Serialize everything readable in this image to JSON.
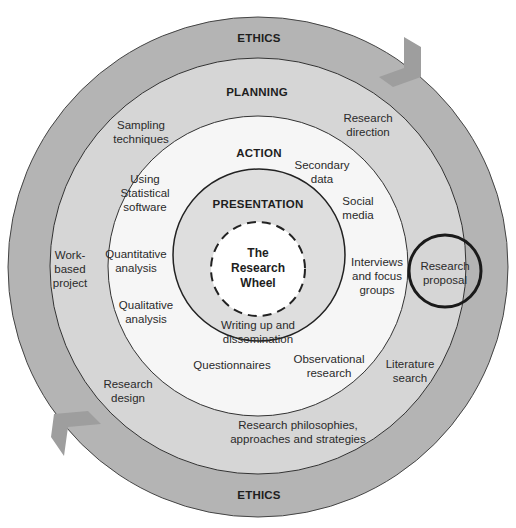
{
  "diagram": {
    "title": "The Research Wheel",
    "colors": {
      "ethics_ring": "#b4b4b4",
      "planning_ring": "#d6d6d6",
      "action_ring": "#f6f6f6",
      "presentation_ring": "#dedede",
      "center": "#ffffff",
      "arrow": "#9e9e9e",
      "outline": "#333333",
      "highlight_circle": "#1a1a1a"
    },
    "rings": {
      "ethics": {
        "label": "ETHICS",
        "label_bottom": "ETHICS"
      },
      "planning": {
        "label": "PLANNING",
        "items": [
          "Sampling\ntechniques",
          "Research\ndirection",
          "Work-\nbased\nproject",
          "Research\nproposal",
          "Research\ndesign",
          "Literature\nsearch",
          "Research philosophies,\napproaches and strategies"
        ]
      },
      "action": {
        "label": "ACTION",
        "items": [
          "Using\nStatistical\nsoftware",
          "Secondary\ndata",
          "Social\nmedia",
          "Quantitative\nanalysis",
          "Interviews\nand focus\ngroups",
          "Qualitative\nanalysis",
          "Questionnaires",
          "Observational\nresearch"
        ]
      },
      "presentation": {
        "label": "PRESENTATION",
        "items": [
          "Writing up and\ndissemination"
        ]
      },
      "center": {
        "label": "The\nResearch\nWheel"
      }
    },
    "highlighted_item": "Research proposal"
  }
}
